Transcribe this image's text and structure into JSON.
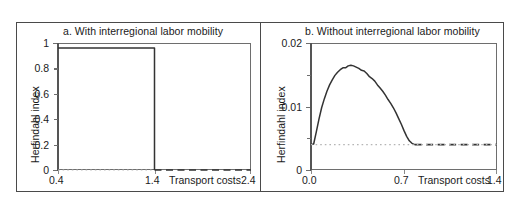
{
  "figure": {
    "panels": [
      {
        "id": "a",
        "title": "a. With interregional labor mobility",
        "ylabel": "Herfindahl index",
        "xcaption": "Transport costs",
        "yticks": [
          "1",
          "0.8",
          "0.6",
          "0.4",
          "0.2",
          "0"
        ],
        "xticks": [
          "0.4",
          "1.4",
          "2.4"
        ]
      },
      {
        "id": "b",
        "title": "b. Without interregional labor mobility",
        "ylabel": "Herfindahl index",
        "xcaption": "Transport costs",
        "yticks": [
          "0.02",
          "0.01",
          "0"
        ],
        "xticks": [
          "0.0",
          "0.7",
          "1.4"
        ]
      }
    ]
  },
  "chart_data": [
    {
      "type": "line",
      "panel": "a",
      "title": "a. With interregional labor mobility",
      "xlabel": "Transport costs",
      "ylabel": "Herfindahl index",
      "xlim": [
        0.4,
        2.4
      ],
      "ylim": [
        0.0,
        1.0
      ],
      "xticks": [
        0.4,
        1.4,
        2.4
      ],
      "yticks": [
        0,
        0.2,
        0.4,
        0.6,
        0.8,
        1
      ],
      "grid": false,
      "legend": null,
      "annotations": [
        "Agglomerated equilibrium is stable until transport costs reach the break point at 1.4, where the index collapses to the dispersed value."
      ],
      "series": [
        {
          "name": "agglomerated-branch",
          "style": "solid",
          "color": "#333333",
          "x": [
            0.4,
            0.6,
            0.8,
            1.0,
            1.2,
            1.4,
            1.4
          ],
          "y": [
            0.96,
            0.96,
            0.96,
            0.96,
            0.96,
            0.96,
            0.0
          ]
        },
        {
          "name": "dispersed-branch",
          "style": "dashed",
          "color": "#333333",
          "x": [
            1.4,
            1.6,
            1.8,
            2.0,
            2.2,
            2.4
          ],
          "y": [
            0.0,
            0.0,
            0.0,
            0.0,
            0.0,
            0.0
          ]
        },
        {
          "name": "dispersed-reference",
          "style": "dotted",
          "color": "#b5b5b5",
          "x": [
            0.4,
            1.4
          ],
          "y": [
            0.0,
            0.0
          ]
        }
      ]
    },
    {
      "type": "line",
      "panel": "b",
      "title": "b. Without interregional labor mobility",
      "xlabel": "Transport costs",
      "ylabel": "Herfindahl index",
      "xlim": [
        0.0,
        1.4
      ],
      "ylim": [
        0.0,
        0.02
      ],
      "xticks": [
        0.0,
        0.7,
        1.4
      ],
      "yticks": [
        0,
        0.01,
        0.02
      ],
      "grid": false,
      "legend": null,
      "annotations": [
        "Concentration rises to a hump-shaped peak near transport costs 0.30 then falls back to the symmetric dispersed level of about 0.004."
      ],
      "series": [
        {
          "name": "herfindahl-curve",
          "style": "solid",
          "color": "#333333",
          "x": [
            0.0,
            0.02,
            0.04,
            0.06,
            0.08,
            0.1,
            0.12,
            0.14,
            0.16,
            0.18,
            0.2,
            0.22,
            0.24,
            0.26,
            0.28,
            0.3,
            0.32,
            0.34,
            0.36,
            0.38,
            0.4,
            0.42,
            0.44,
            0.46,
            0.48,
            0.5,
            0.52,
            0.54,
            0.56,
            0.58,
            0.6,
            0.62,
            0.64,
            0.66,
            0.68,
            0.7,
            0.72,
            0.74,
            0.76,
            0.78
          ],
          "y": [
            0.004,
            0.0041,
            0.006,
            0.008,
            0.0098,
            0.0112,
            0.0124,
            0.0134,
            0.0142,
            0.0149,
            0.0154,
            0.0158,
            0.0161,
            0.0161,
            0.0164,
            0.0165,
            0.0164,
            0.0162,
            0.016,
            0.0157,
            0.0156,
            0.0152,
            0.0147,
            0.0144,
            0.014,
            0.0134,
            0.0129,
            0.0124,
            0.0118,
            0.0111,
            0.0105,
            0.0098,
            0.009,
            0.0081,
            0.0072,
            0.0062,
            0.0053,
            0.0046,
            0.0042,
            0.004
          ]
        },
        {
          "name": "dispersed-branch",
          "style": "dashed",
          "color": "#333333",
          "x": [
            0.78,
            0.9,
            1.0,
            1.1,
            1.2,
            1.3,
            1.4
          ],
          "y": [
            0.004,
            0.004,
            0.004,
            0.004,
            0.004,
            0.004,
            0.004
          ]
        },
        {
          "name": "dispersed-reference",
          "style": "dotted",
          "color": "#b5b5b5",
          "x": [
            0.0,
            1.4
          ],
          "y": [
            0.004,
            0.004
          ]
        }
      ]
    }
  ]
}
